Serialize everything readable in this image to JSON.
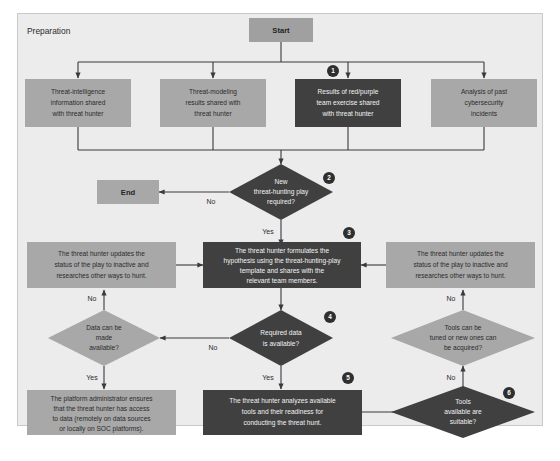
{
  "diagram": {
    "title": "Preparation",
    "colors": {
      "frame_bg": "#ececed",
      "frame_border": "#c9c9ca",
      "node_light": "#a8a8a9",
      "node_dark": "#404041",
      "connector": "#3a3a3b",
      "badge": "#2f2f30",
      "text_dark": "#2b2b2b",
      "text_light": "#f2f2f2"
    },
    "terminals": {
      "start": "Start",
      "end": "End"
    },
    "nodes": {
      "threat_intel": {
        "lines": [
          "Threat-intelligence",
          "information shared",
          "with threat hunter"
        ],
        "style": "light"
      },
      "threat_modeling": {
        "lines": [
          "Threat-modeling",
          "results shared with",
          "threat hunter"
        ],
        "style": "light"
      },
      "red_purple": {
        "lines": [
          "Results of red/purple",
          "team exercise shared",
          "with threat hunter"
        ],
        "style": "dark"
      },
      "past_incidents": {
        "lines": [
          "Analysis of past",
          "cybersecurity",
          "incidents"
        ],
        "style": "light"
      },
      "new_play_required": {
        "lines": [
          "New",
          "threat-hunting play",
          "required?"
        ],
        "style": "dark",
        "shape": "diamond"
      },
      "update_status_left": {
        "lines": [
          "The threat hunter updates the",
          "status of the play to inactive and",
          "researches other ways to hunt."
        ],
        "style": "light"
      },
      "formulate_hypothesis": {
        "lines": [
          "The threat hunter formulates the",
          "hypothesis using the threat-hunting-play",
          "template and shares with the",
          "relevant team members."
        ],
        "style": "dark"
      },
      "update_status_right": {
        "lines": [
          "The threat hunter updates the",
          "status of the play to inactive and",
          "researches other ways to hunt."
        ],
        "style": "light"
      },
      "data_can_be_made": {
        "lines": [
          "Data can be",
          "made",
          "available?"
        ],
        "style": "light",
        "shape": "diamond"
      },
      "required_data_available": {
        "lines": [
          "Required data",
          "is available?"
        ],
        "style": "dark",
        "shape": "diamond"
      },
      "tools_tuned_acquired": {
        "lines": [
          "Tools can be",
          "tuned or new ones can",
          "be acquired?"
        ],
        "style": "light",
        "shape": "diamond"
      },
      "platform_admin": {
        "lines": [
          "The platform administrator ensures",
          "that the threat hunter has access",
          "to data (remotely on data sources",
          "or locally on SOC platforms)."
        ],
        "style": "light"
      },
      "analyze_tools": {
        "lines": [
          "The threat hunter analyzes available",
          "tools and their readiness for",
          "conducting the threat hunt."
        ],
        "style": "dark"
      },
      "tools_suitable": {
        "lines": [
          "Tools",
          "available are",
          "suitable?"
        ],
        "style": "dark",
        "shape": "diamond"
      }
    },
    "edge_labels": {
      "no_to_end": "No",
      "yes_to_hypothesis": "Yes",
      "no_data_available": "No",
      "yes_data_available": "Yes",
      "no_data_can_be_made": "No",
      "yes_data_can_be_made": "Yes",
      "no_tools_suitable": "No",
      "no_tools_tuned": "No"
    },
    "badges": [
      {
        "number": "1",
        "x": 333,
        "y": 71
      },
      {
        "number": "2",
        "x": 329,
        "y": 178
      },
      {
        "number": "3",
        "x": 349,
        "y": 233
      },
      {
        "number": "4",
        "x": 330,
        "y": 317
      },
      {
        "number": "5",
        "x": 348,
        "y": 378
      },
      {
        "number": "6",
        "x": 509,
        "y": 393
      }
    ]
  }
}
